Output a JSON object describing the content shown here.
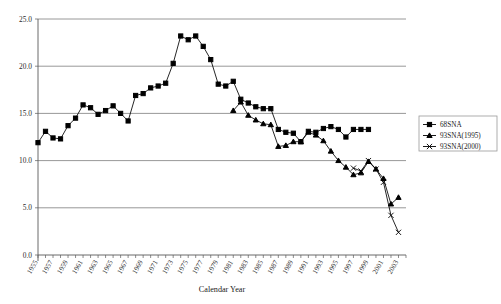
{
  "chart_data": {
    "type": "line",
    "title": "",
    "xlabel": "Calendar Year",
    "ylabel": "",
    "xlim": [
      1955,
      2004
    ],
    "ylim": [
      0.0,
      25.0
    ],
    "grid": true,
    "legend_position": "right",
    "ytick_labels": [
      "25.0",
      "20.0",
      "15.0",
      "10.0",
      "5.0",
      "0.0"
    ],
    "ytick_values": [
      25.0,
      20.0,
      15.0,
      10.0,
      5.0,
      0.0
    ],
    "xtick_labels": [
      "1955",
      "1957",
      "1959",
      "1961",
      "1963",
      "1965",
      "1967",
      "1969",
      "1971",
      "1973",
      "1975",
      "1977",
      "1979",
      "1981",
      "1983",
      "1985",
      "1987",
      "1989",
      "1991",
      "1993",
      "1995",
      "1997",
      "1999",
      "2001",
      "2003"
    ],
    "xtick_values": [
      1955,
      1957,
      1959,
      1961,
      1963,
      1965,
      1967,
      1969,
      1971,
      1973,
      1975,
      1977,
      1979,
      1981,
      1983,
      1985,
      1987,
      1989,
      1991,
      1993,
      1995,
      1997,
      1999,
      2001,
      2003
    ],
    "series": [
      {
        "name": "68SNA",
        "marker": "square",
        "x": [
          1955,
          1956,
          1957,
          1958,
          1959,
          1960,
          1961,
          1962,
          1963,
          1964,
          1965,
          1966,
          1967,
          1968,
          1969,
          1970,
          1971,
          1972,
          1973,
          1974,
          1975,
          1976,
          1977,
          1978,
          1979,
          1980,
          1981,
          1982,
          1983,
          1984,
          1985,
          1986,
          1987,
          1988,
          1989,
          1990,
          1991,
          1992,
          1993,
          1994,
          1995,
          1996,
          1997,
          1998,
          1999
        ],
        "values": [
          11.9,
          13.1,
          12.4,
          12.3,
          13.7,
          14.5,
          15.9,
          15.6,
          14.9,
          15.3,
          15.8,
          15.0,
          14.2,
          16.9,
          17.1,
          17.7,
          17.9,
          18.2,
          20.3,
          23.2,
          22.8,
          23.2,
          22.1,
          20.7,
          18.1,
          17.9,
          18.4,
          16.5,
          16.1,
          15.7,
          15.5,
          15.5,
          13.3,
          13.0,
          12.9,
          12.0,
          13.1,
          13.0,
          13.4,
          13.6,
          13.3,
          12.5,
          13.3,
          13.3,
          13.3
        ]
      },
      {
        "name": "93SNA(1995)",
        "marker": "triangle",
        "x": [
          1981,
          1982,
          1983,
          1984,
          1985,
          1986,
          1987,
          1988,
          1989,
          1990,
          1991,
          1992,
          1993,
          1994,
          1995,
          1996,
          1997,
          1998,
          1999,
          2000,
          2001,
          2002,
          2003
        ],
        "values": [
          15.3,
          16.2,
          14.8,
          14.3,
          13.9,
          13.8,
          11.5,
          11.6,
          12.0,
          12.0,
          13.0,
          12.7,
          12.1,
          11.0,
          10.0,
          9.3,
          8.5,
          8.7,
          9.9,
          9.1,
          8.1,
          5.4,
          6.1
        ]
      },
      {
        "name": "93SNA(2000)",
        "marker": "x",
        "x": [
          1997,
          1998,
          1999,
          2000,
          2001,
          2002,
          2003
        ],
        "values": [
          9.2,
          8.9,
          10.0,
          9.1,
          7.7,
          4.2,
          2.4
        ]
      }
    ]
  },
  "legend": {
    "items": [
      {
        "label": "68SNA"
      },
      {
        "label": "93SNA(1995)"
      },
      {
        "label": "93SNA(2000)"
      }
    ]
  },
  "axis": {
    "x_title": "Calendar Year"
  }
}
